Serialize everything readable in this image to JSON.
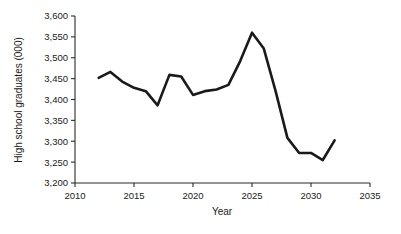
{
  "chart_data": {
    "type": "line",
    "title": "",
    "subtitle": "",
    "xlabel": "Year",
    "ylabel": "High school graduates (000)",
    "xlim": [
      2010,
      2035
    ],
    "ylim": [
      3200,
      3600
    ],
    "xticks": [
      2010,
      2015,
      2020,
      2025,
      2030,
      2035
    ],
    "xtick_labels": [
      "2010",
      "2015",
      "2020",
      "2025",
      "2030",
      "2035"
    ],
    "yticks": [
      3200,
      3250,
      3300,
      3350,
      3400,
      3450,
      3500,
      3550,
      3600
    ],
    "ytick_labels": [
      "3,200",
      "3,250",
      "3,300",
      "3,350",
      "3,400",
      "3,450",
      "3,500",
      "3,550",
      "3,600"
    ],
    "grid": false,
    "legend": false,
    "legend_position": "none",
    "annotations": [],
    "series": [
      {
        "name": "High school graduates",
        "color": "#1a1a1a",
        "x": [
          2012,
          2013,
          2014,
          2015,
          2016,
          2017,
          2018,
          2019,
          2020,
          2021,
          2022,
          2023,
          2024,
          2025,
          2026,
          2027,
          2028,
          2029,
          2030,
          2031,
          2032
        ],
        "values": [
          3452,
          3466,
          3443,
          3428,
          3420,
          3386,
          3459,
          3455,
          3411,
          3420,
          3424,
          3435,
          3492,
          3560,
          3522,
          3420,
          3308,
          3272,
          3272,
          3255,
          3302
        ]
      }
    ]
  },
  "axis": {
    "y_label": "High school graduates (000)",
    "x_label": "Year"
  }
}
